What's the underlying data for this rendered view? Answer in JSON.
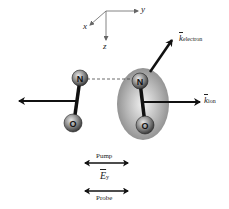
{
  "axes": {
    "x_label": "x",
    "y_label": "y",
    "z_label": "z"
  },
  "molecules": [
    {
      "name": "NO-left",
      "atoms": [
        "N",
        "O"
      ]
    },
    {
      "name": "NO-right",
      "atoms": [
        "N",
        "O"
      ],
      "highlighted": true
    }
  ],
  "vectors": {
    "k_electron": {
      "symbol": "k",
      "subscript": "electron"
    },
    "k_ion": {
      "symbol": "k",
      "subscript": "ion"
    }
  },
  "polarization": {
    "pump_label": "Pump",
    "field_symbol": "E",
    "field_subscript": "y",
    "probe_label": "Probe"
  },
  "colors": {
    "line": "#111111",
    "atom": "#8a8a8a",
    "ellipse": "#9a9a9a"
  }
}
